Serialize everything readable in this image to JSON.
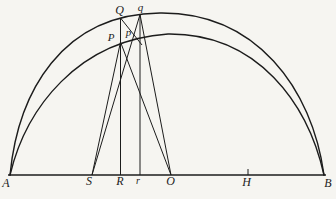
{
  "figure": {
    "background": "#f6f5f1",
    "ink": "#1c1c1c",
    "width": 336,
    "height": 199,
    "curves": [
      {
        "name": "outer-arc",
        "d": "M 10 175 C 18 92, 62 14, 160 13 C 256 12, 312 88, 324 175"
      },
      {
        "name": "inner-arc",
        "d": "M 10 175 C 26 108, 78 40, 168 34 C 258 33, 308 104, 324 175"
      }
    ],
    "segments": [
      {
        "name": "baseline-AB",
        "x1": 8,
        "y1": 175,
        "x2": 326,
        "y2": 175
      },
      {
        "name": "ordinate-RQ",
        "x1": 120.5,
        "y1": 175,
        "x2": 120.5,
        "y2": 18
      },
      {
        "name": "ordinate-rq",
        "x1": 140,
        "y1": 175,
        "x2": 140,
        "y2": 14.5
      },
      {
        "name": "line-SP",
        "x1": 92,
        "y1": 175,
        "x2": 120.5,
        "y2": 42
      },
      {
        "name": "line-Sq",
        "x1": 92,
        "y1": 175,
        "x2": 140,
        "y2": 14.5
      },
      {
        "name": "line-OP",
        "x1": 171,
        "y1": 175,
        "x2": 120.5,
        "y2": 42
      },
      {
        "name": "line-Oq",
        "x1": 171,
        "y1": 175,
        "x2": 140,
        "y2": 14.5
      },
      {
        "name": "segment-Qp",
        "x1": 120.5,
        "y1": 18,
        "x2": 142,
        "y2": 45
      },
      {
        "name": "tick-H",
        "x1": 248,
        "y1": 169,
        "x2": 248,
        "y2": 175
      }
    ],
    "labels": [
      {
        "name": "label-A",
        "text": "A",
        "x": 6,
        "y": 187,
        "size": 12
      },
      {
        "name": "label-S",
        "text": "S",
        "x": 89,
        "y": 185,
        "size": 12
      },
      {
        "name": "label-R",
        "text": "R",
        "x": 120,
        "y": 185,
        "size": 12
      },
      {
        "name": "label-r",
        "text": "r",
        "x": 138,
        "y": 184,
        "size": 10
      },
      {
        "name": "label-O",
        "text": "O",
        "x": 170.5,
        "y": 185,
        "size": 12
      },
      {
        "name": "label-H",
        "text": "H",
        "x": 246.5,
        "y": 186,
        "size": 12
      },
      {
        "name": "label-B",
        "text": "B",
        "x": 328,
        "y": 187,
        "size": 12
      },
      {
        "name": "label-Q",
        "text": "Q",
        "x": 119.5,
        "y": 14,
        "size": 12
      },
      {
        "name": "label-q",
        "text": "q",
        "x": 140.5,
        "y": 11,
        "size": 11
      },
      {
        "name": "label-P",
        "text": "P",
        "x": 111,
        "y": 41,
        "size": 11
      },
      {
        "name": "label-p",
        "text": "p",
        "x": 128.5,
        "y": 36,
        "size": 11
      }
    ]
  }
}
